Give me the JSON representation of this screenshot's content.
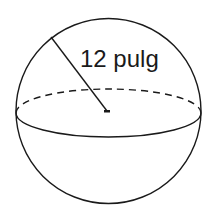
{
  "diagram": {
    "type": "sphere",
    "radius_label": "12 pulg",
    "stroke_color": "#1a1a1a",
    "background": "#ffffff"
  }
}
